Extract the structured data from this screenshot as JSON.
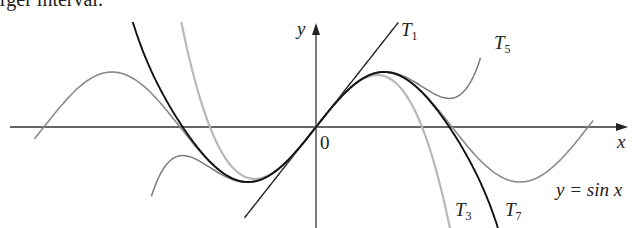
{
  "header_fragment": "rger interval.",
  "chart_data": {
    "type": "line",
    "title": "",
    "xlabel": "x",
    "ylabel": "y",
    "origin_label": "0",
    "xlim": [
      -6.6,
      7.2
    ],
    "ylim": [
      -1.8,
      1.9
    ],
    "grid": false,
    "series": [
      {
        "name": "y = sin x",
        "label": "y = sin x",
        "color": "#8a8a8a",
        "expr": "sin(x)",
        "domain": [
          -6.5,
          6.4
        ]
      },
      {
        "name": "T1",
        "label": "T1",
        "color": "#222222",
        "expr": "x",
        "domain": [
          -1.65,
          1.9
        ]
      },
      {
        "name": "T3",
        "label": "T3",
        "color": "#b8b8b8",
        "expr": "x - x^3/6",
        "domain": [
          -3.2,
          3.2
        ]
      },
      {
        "name": "T5",
        "label": "T5",
        "color": "#7a7a7a",
        "expr": "x - x^3/6 + x^5/120",
        "domain": [
          -3.8,
          3.8
        ]
      },
      {
        "name": "T7",
        "label": "T7",
        "color": "#111111",
        "expr": "x - x^3/6 + x^5/120 - x^7/5040",
        "domain": [
          -4.3,
          4.3
        ]
      }
    ]
  },
  "labels": {
    "y_axis": "y",
    "x_axis": "x",
    "origin": "0",
    "T": "T",
    "t1_sub": "1",
    "t3_sub": "3",
    "t5_sub": "5",
    "t7_sub": "7",
    "sin_label": "y = sin x"
  }
}
